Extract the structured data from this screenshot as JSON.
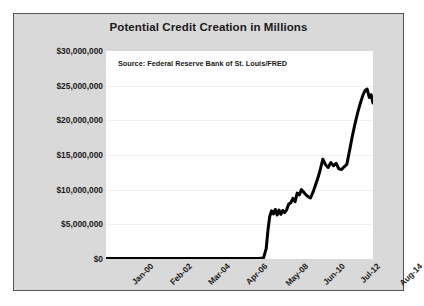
{
  "chart_data": {
    "type": "line",
    "title": "Potential Credit Creation in Millions",
    "annotation": "Source: Federal Reserve Bank of St. Louis/FRED",
    "xlabel": "",
    "ylabel": "",
    "grid": true,
    "legend": "none",
    "ylim": [
      0,
      30000000
    ],
    "yticks": [
      0,
      5000000,
      10000000,
      15000000,
      20000000,
      25000000,
      30000000
    ],
    "ytick_labels": [
      "$0",
      "$5,000,000",
      "$10,000,000",
      "$15,000,000",
      "$20,000,000",
      "$25,000,000",
      "$30,000,000"
    ],
    "xtick_labels": [
      "Jan-00",
      "Feb-02",
      "Mar-04",
      "Apr-06",
      "May-08",
      "Jun-10",
      "Jul-12",
      "Aug-14"
    ],
    "xtick_positions": [
      0.0,
      0.1429,
      0.2857,
      0.4286,
      0.5714,
      0.7143,
      0.8571,
      1.0
    ],
    "line_color": "#000000",
    "line_width": 3,
    "series": [
      {
        "name": "Potential Credit Creation",
        "x": [
          0.0,
          0.12,
          0.24,
          0.36,
          0.44,
          0.52,
          0.57,
          0.59,
          0.6,
          0.607,
          0.613,
          0.62,
          0.627,
          0.634,
          0.641,
          0.648,
          0.655,
          0.662,
          0.669,
          0.676,
          0.684,
          0.692,
          0.7,
          0.708,
          0.716,
          0.724,
          0.732,
          0.74,
          0.748,
          0.757,
          0.766,
          0.775,
          0.784,
          0.793,
          0.802,
          0.812,
          0.822,
          0.832,
          0.842,
          0.852,
          0.862,
          0.872,
          0.882,
          0.892,
          0.902,
          0.912,
          0.922,
          0.932,
          0.942,
          0.952,
          0.962,
          0.97,
          0.978,
          0.986,
          0.993,
          1.0
        ],
        "y": [
          60000,
          60000,
          60000,
          60000,
          60000,
          60000,
          60000,
          150000,
          1500000,
          4300000,
          6100000,
          6950000,
          6500000,
          7150000,
          6350000,
          7050000,
          6450000,
          7000000,
          6700000,
          7050000,
          7900000,
          8100000,
          8750000,
          8250000,
          9500000,
          9250000,
          10000000,
          9650000,
          9300000,
          9000000,
          8800000,
          9600000,
          10600000,
          11600000,
          12800000,
          14400000,
          13600000,
          13200000,
          13900000,
          13450000,
          13800000,
          13000000,
          12900000,
          13300000,
          13650000,
          15600000,
          17600000,
          19400000,
          21000000,
          22400000,
          23600000,
          24300000,
          24500000,
          23300000,
          23700000,
          22500000
        ]
      }
    ]
  },
  "frame": {
    "background_color": "#d9d9d9",
    "border_color": "#555555",
    "plot_background_color": "#ffffff",
    "gridline_color": "#f0f0f0"
  }
}
